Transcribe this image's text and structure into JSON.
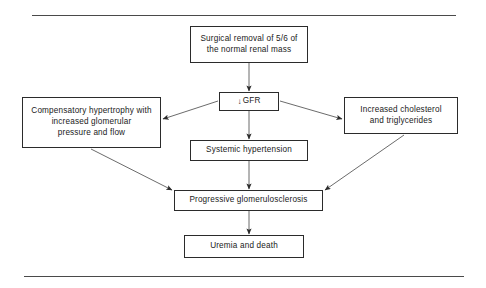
{
  "figure": {
    "name": "renal-mass-reduction-pathophysiology-flowchart",
    "orientation": "top-to-bottom",
    "background_color": "#ffffff",
    "line_color": "#2b2b2b",
    "rule_color": "#4a4a4a",
    "text_color": "#1a1a1a"
  },
  "rules": {
    "top_label": "top-horizontal-rule",
    "bottom_label": "bottom-horizontal-rule"
  },
  "nodes": {
    "surgical": {
      "id": "surgical",
      "text": "Surgical removal of 5/6 of\nthe normal renal mass"
    },
    "gfr": {
      "id": "gfr",
      "arrow_symbol": "↓",
      "text": "GFR",
      "full_text": "↓ GFR"
    },
    "compensatory": {
      "id": "compensatory",
      "text": "Compensatory hypertrophy with\nincreased glomerular\npressure and flow"
    },
    "cholesterol": {
      "id": "cholesterol",
      "text": "Increased cholesterol\nand triglycerides"
    },
    "systemic": {
      "id": "systemic",
      "text": "Systemic hypertension"
    },
    "progressive": {
      "id": "progressive",
      "text": "Progressive glomerulosclerosis"
    },
    "uremia": {
      "id": "uremia",
      "text": "Uremia and death"
    }
  },
  "edges": [
    {
      "id": "surgical-to-gfr",
      "from": "surgical",
      "to": "gfr",
      "style": "vertical-arrow"
    },
    {
      "id": "gfr-to-compensatory",
      "from": "gfr",
      "to": "compensatory",
      "style": "diagonal-arrow-left"
    },
    {
      "id": "gfr-to-cholesterol",
      "from": "gfr",
      "to": "cholesterol",
      "style": "diagonal-arrow-right"
    },
    {
      "id": "gfr-to-systemic",
      "from": "gfr",
      "to": "systemic",
      "style": "vertical-arrow"
    },
    {
      "id": "systemic-to-progressive",
      "from": "systemic",
      "to": "progressive",
      "style": "vertical-arrow"
    },
    {
      "id": "compensatory-to-progressive",
      "from": "compensatory",
      "to": "progressive",
      "style": "diagonal-arrow-right"
    },
    {
      "id": "cholesterol-to-progressive",
      "from": "cholesterol",
      "to": "progressive",
      "style": "diagonal-arrow-left"
    },
    {
      "id": "progressive-to-uremia",
      "from": "progressive",
      "to": "uremia",
      "style": "vertical-arrow"
    }
  ]
}
